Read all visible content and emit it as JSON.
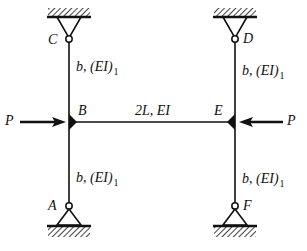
{
  "diagram": {
    "title": "",
    "type": "structural-frame",
    "colors": {
      "line": "#111111",
      "background": "#ffffff"
    },
    "nodes": {
      "A": {
        "label": "A",
        "support": "pin"
      },
      "B": {
        "label": "B",
        "joint": "rigid"
      },
      "C": {
        "label": "C",
        "support": "pin"
      },
      "D": {
        "label": "D",
        "support": "pin"
      },
      "E": {
        "label": "E",
        "joint": "rigid"
      },
      "F": {
        "label": "F",
        "support": "pin"
      }
    },
    "members": [
      {
        "id": "CB",
        "from": "C",
        "to": "B",
        "length": "b",
        "stiffness": "(EI)",
        "stiffness_sub": "1",
        "sep": ", "
      },
      {
        "id": "BA",
        "from": "B",
        "to": "A",
        "length": "b",
        "stiffness": "(EI)",
        "stiffness_sub": "1",
        "sep": ", "
      },
      {
        "id": "DE",
        "from": "D",
        "to": "E",
        "length": "b",
        "stiffness": "(EI)",
        "stiffness_sub": "1",
        "sep": ", "
      },
      {
        "id": "EF",
        "from": "E",
        "to": "F",
        "length": "b",
        "stiffness": "(EI)",
        "stiffness_sub": "1",
        "sep": ", "
      },
      {
        "id": "BE",
        "from": "B",
        "to": "E",
        "length": "2L",
        "stiffness": "EI",
        "stiffness_sub": "",
        "sep": ", "
      }
    ],
    "loads": [
      {
        "id": "P-left",
        "label": "P",
        "at": "B",
        "direction": "right"
      },
      {
        "id": "P-right",
        "label": "P",
        "at": "E",
        "direction": "left"
      }
    ]
  }
}
